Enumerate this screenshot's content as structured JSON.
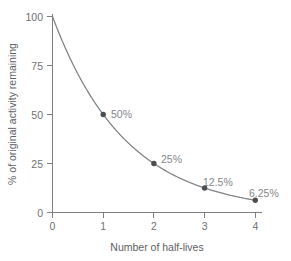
{
  "chart_data": {
    "type": "line",
    "title": "",
    "xlabel": "Number of half-lives",
    "ylabel": "% of original activity remaining",
    "x": [
      0,
      1,
      2,
      3,
      4
    ],
    "values": [
      100,
      50,
      25,
      12.5,
      6.25
    ],
    "series": [
      {
        "name": "% of original activity remaining",
        "values": [
          100,
          50,
          25,
          12.5,
          6.25
        ]
      }
    ],
    "xlim": [
      0,
      4
    ],
    "ylim": [
      0,
      100
    ],
    "xticks": [
      "0",
      "1",
      "2",
      "3",
      "4"
    ],
    "yticks": [
      "0",
      "25",
      "50",
      "75",
      "100"
    ],
    "grid": false,
    "legend": "none",
    "markers": [
      {
        "x": 1,
        "y": 50,
        "label": "50%"
      },
      {
        "x": 2,
        "y": 25,
        "label": "25%"
      },
      {
        "x": 3,
        "y": 12.5,
        "label": "12.5%"
      },
      {
        "x": 4,
        "y": 6.25,
        "label": "6.25%"
      }
    ],
    "annotations": [
      "50%",
      "25%",
      "12.5%",
      "6.25%"
    ],
    "colors": {
      "curve": "#7e8083",
      "marker": "#4b4d4f",
      "axis": "#7d7f81",
      "tick_label": "#6f7173",
      "axis_title": "#5e6063",
      "point_label": "#85878a",
      "background": "#ffffff"
    }
  },
  "axes": {
    "x_title": "Number of half-lives",
    "y_title": "% of original activity remaining",
    "x_tick_labels": [
      "0",
      "1",
      "2",
      "3",
      "4"
    ],
    "y_tick_labels": [
      "100",
      "75",
      "50",
      "25",
      "0"
    ]
  },
  "point_labels": {
    "p1": "50%",
    "p2": "25%",
    "p3": "12.5%",
    "p4": "6.25%"
  }
}
